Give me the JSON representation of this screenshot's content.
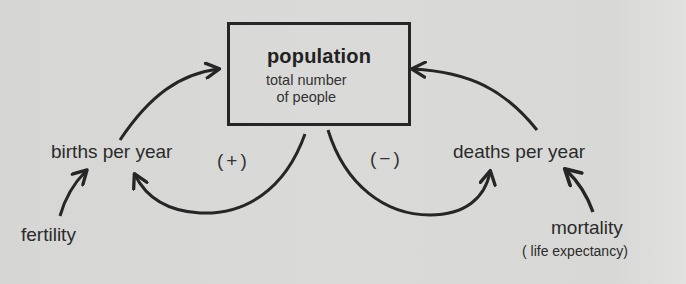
{
  "diagram": {
    "type": "causal-loop",
    "stock": {
      "title": "population",
      "subtitle_line1": "total number",
      "subtitle_line2": "of people"
    },
    "flows": {
      "births": "births per year",
      "deaths": "deaths per year"
    },
    "drivers": {
      "fertility": "fertility",
      "mortality": "mortality",
      "mortality_note": "( life expectancy)"
    },
    "loops": {
      "positive": "(+)",
      "negative": "(−)"
    },
    "colors": {
      "background": "#d9d9d7",
      "ink": "#262626"
    }
  }
}
